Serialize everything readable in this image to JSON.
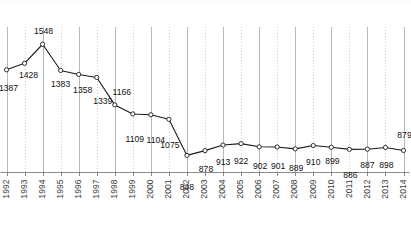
{
  "chart_data": {
    "type": "line",
    "title": "",
    "subtitle": "",
    "xlabel": "",
    "ylabel": "",
    "grid": true,
    "legend_position": "none",
    "ylim": [
      800,
      1600
    ],
    "categories": [
      "1992",
      "1993",
      "1994",
      "1995",
      "1996",
      "1997",
      "1998",
      "1999",
      "2000",
      "2001",
      "2002",
      "2003",
      "2004",
      "2005",
      "2006",
      "2007",
      "2008",
      "2009",
      "2010",
      "2011",
      "2012",
      "2013",
      "2014"
    ],
    "values": [
      1387,
      1428,
      1548,
      1383,
      1358,
      1339,
      1166,
      1109,
      1104,
      1075,
      848,
      878,
      913,
      922,
      902,
      901,
      889,
      910,
      899,
      886,
      887,
      898,
      879
    ],
    "data_labels": [
      "1387",
      "1428",
      "1548",
      "1383",
      "1358",
      "1339",
      "1166",
      "1109",
      "1104",
      "1075",
      "848",
      "878",
      "913",
      "922",
      "902",
      "901",
      "889",
      "910",
      "899",
      "886",
      "887",
      "898",
      "879"
    ],
    "series": [
      {
        "name": "",
        "values": [
          1387,
          1428,
          1548,
          1383,
          1358,
          1339,
          1166,
          1109,
          1104,
          1075,
          848,
          878,
          913,
          922,
          902,
          901,
          889,
          910,
          899,
          886,
          887,
          898,
          879
        ],
        "color": "#1a1a1a",
        "marker": "open-circle"
      }
    ],
    "colors": {
      "line": "#1a1a1a",
      "marker_fill": "#ffffff",
      "marker_stroke": "#1a1a1a",
      "gridline_solid": "#9a9a9a",
      "gridline_dotted": "#b5b5b5",
      "axis": "#6d6d6d",
      "label_text": "#121212",
      "tick_text": "#3d3d3d",
      "background": "#ffffff"
    }
  }
}
